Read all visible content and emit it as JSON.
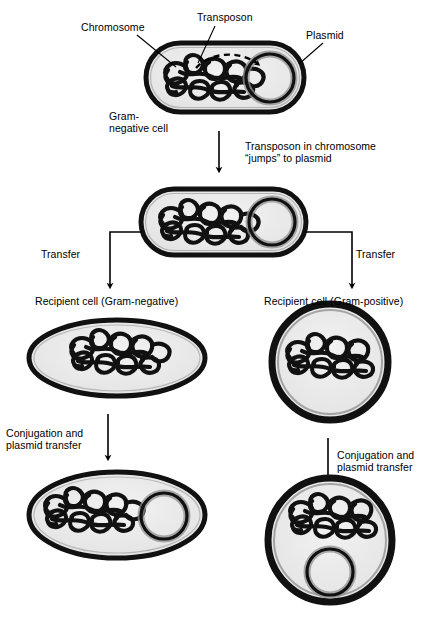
{
  "figure": {
    "background_color": "#ffffff",
    "line_color": "#000000",
    "cell_fill_color": "#e8e8e8",
    "wall_color": "#111111"
  },
  "labels": {
    "chromosome": "Chromosome",
    "transposon": "Transposon",
    "plasmid": "Plasmid",
    "gram_negative_cell_line1": "Gram-",
    "gram_negative_cell_line2": "negative cell",
    "jump_step_line1": "Transposon in chromosome",
    "jump_step_line2": "“jumps” to plasmid",
    "transfer_left": "Transfer",
    "transfer_right": "Transfer",
    "recipient_left": "Recipient cell (Gram-negative)",
    "recipient_right": "Recipient cell (Gram-positive)",
    "conjugation_left_line1": "Conjugation and",
    "conjugation_left_line2": "plasmid transfer",
    "conjugation_right_line1": "Conjugation and",
    "conjugation_right_line2": "plasmid transfer"
  },
  "cells": {
    "donor_top": {
      "name": "Gram-negative donor cell",
      "shape": "rod",
      "has_chromosome": true,
      "has_plasmid": true,
      "transposon_in": "chromosome"
    },
    "donor_middle": {
      "name": "Gram-negative donor cell after transposition",
      "shape": "rod",
      "has_chromosome": true,
      "has_plasmid": true,
      "transposon_in": "plasmid"
    },
    "recipient_left": {
      "name": "Recipient cell (Gram-negative)",
      "shape": "ellipse",
      "has_chromosome": true,
      "has_plasmid": false
    },
    "recipient_right": {
      "name": "Recipient cell (Gram-positive)",
      "shape": "circle",
      "has_chromosome": true,
      "has_plasmid": false
    },
    "transconjugant_left": {
      "name": "Transconjugant (Gram-negative)",
      "shape": "ellipse",
      "has_chromosome": true,
      "has_plasmid": true
    },
    "transconjugant_right": {
      "name": "Transconjugant (Gram-positive)",
      "shape": "circle",
      "has_chromosome": true,
      "has_plasmid": true
    }
  }
}
